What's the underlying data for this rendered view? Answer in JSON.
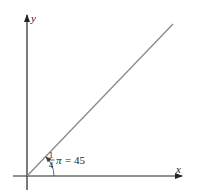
{
  "diagram": {
    "type": "angle-diagram",
    "axes": {
      "x_label": "x",
      "y_label": "y"
    },
    "line": {
      "description": "ray from origin at 45 degrees",
      "color": "#8a8a8a"
    },
    "angle_label": {
      "numerator": "1",
      "denominator": "4",
      "symbol": "π",
      "equals_value": "= 45"
    },
    "colors": {
      "axis": "#222222",
      "ray": "#8a8a8a",
      "background": "#ffffff"
    }
  }
}
